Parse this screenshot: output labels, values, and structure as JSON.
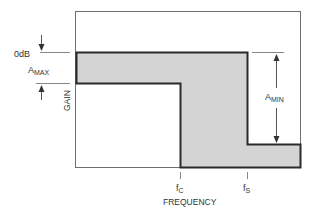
{
  "diagram": {
    "type": "lowpass-filter-template",
    "labels": {
      "zero_db": "0dB",
      "a_max_main": "A",
      "a_max_sub": "MAX",
      "a_min_main": "A",
      "a_min_sub": "MIN",
      "y_axis": "GAIN",
      "x_axis": "FREQUENCY",
      "fc_main": "f",
      "fc_sub": "C",
      "fs_main": "f",
      "fs_sub": "S"
    },
    "colors": {
      "frame": "#6e6e6e",
      "outline": "#2a2a2a",
      "fill": "#d4d4d4",
      "text": "#333333"
    }
  }
}
